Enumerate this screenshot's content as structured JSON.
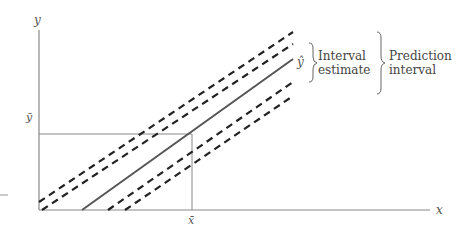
{
  "diagram": {
    "type": "regression-confidence-prediction-bands",
    "axes": {
      "x_label": "x",
      "y_label": "y",
      "x_mean_label": "x̄",
      "y_mean_label": "ȳ"
    },
    "lines": [
      {
        "name": "regression-line",
        "style": "solid",
        "label": "ŷ"
      },
      {
        "name": "interval-estimate-upper",
        "style": "dashed"
      },
      {
        "name": "interval-estimate-lower",
        "style": "dashed"
      },
      {
        "name": "prediction-interval-upper",
        "style": "dashed"
      },
      {
        "name": "prediction-interval-lower",
        "style": "dashed"
      }
    ],
    "annotations": {
      "interval_estimate": {
        "line1": "Interval",
        "line2": "estimate"
      },
      "prediction_interval": {
        "line1": "Prediction",
        "line2": "interval"
      }
    },
    "colors": {
      "axis": "#888888",
      "regression": "#666666",
      "dashed": "#222222",
      "text": "#444444"
    }
  }
}
